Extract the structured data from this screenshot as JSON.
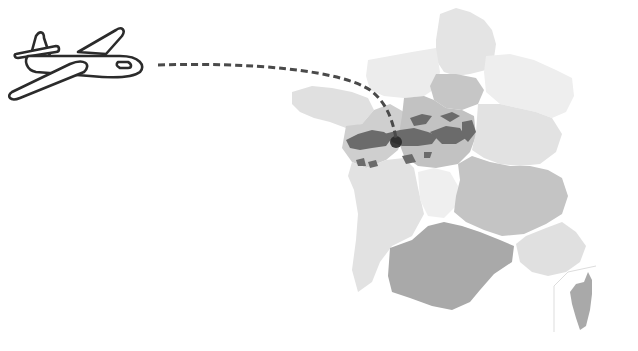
{
  "illustration": {
    "title": "Flight to the Loire Valley, France",
    "plane": {
      "icon": "airplane-icon",
      "stroke": "#2b2b2b",
      "fill": "#ffffff"
    },
    "flight_path": {
      "style": "dashed",
      "color": "#4a4a4a"
    },
    "destination_marker": {
      "color": "#2a2a2a"
    }
  },
  "map": {
    "country": "France",
    "colors": {
      "lightest": "#ececec",
      "light": "#e2e2e2",
      "medium_light": "#d6d6d6",
      "medium": "#c2c2c2",
      "dark": "#a9a9a9",
      "highlight": "#6b6b6b",
      "highlight_dark": "#4a4a4a",
      "background": "#ffffff"
    },
    "regions": [
      {
        "name": "Hauts-de-France",
        "shade": "light"
      },
      {
        "name": "Normandie",
        "shade": "lightest"
      },
      {
        "name": "Bretagne",
        "shade": "light"
      },
      {
        "name": "Île-de-France",
        "shade": "medium"
      },
      {
        "name": "Grand Est",
        "shade": "lightest"
      },
      {
        "name": "Pays de la Loire",
        "shade": "medium"
      },
      {
        "name": "Centre-Val de Loire",
        "shade": "medium"
      },
      {
        "name": "Bourgogne-Franche-Comté",
        "shade": "light"
      },
      {
        "name": "Nouvelle-Aquitaine",
        "shade": "light"
      },
      {
        "name": "Limousin area",
        "shade": "lightest"
      },
      {
        "name": "Auvergne-Rhône-Alpes",
        "shade": "medium"
      },
      {
        "name": "Occitanie",
        "shade": "dark"
      },
      {
        "name": "Provence-Alpes-Côte d'Azur",
        "shade": "light"
      },
      {
        "name": "Corse",
        "shade": "dark"
      }
    ],
    "highlighted_area": "Loire Valley"
  }
}
